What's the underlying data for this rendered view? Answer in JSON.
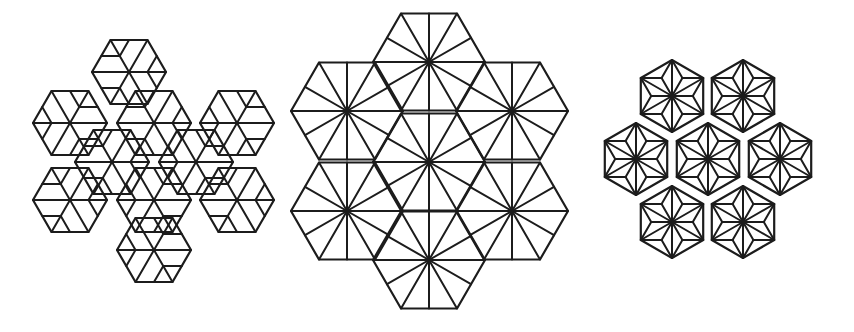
{
  "figure": {
    "stroke_color": "#1c1c1c",
    "background": "#ffffff",
    "panels": [
      {
        "id": "left",
        "label": "",
        "hexagons": [
          {
            "cx": 129,
            "cy": 72,
            "r": 37,
            "rot": 0
          },
          {
            "cx": 70,
            "cy": 123,
            "r": 37,
            "rot": 0
          },
          {
            "cx": 154,
            "cy": 123,
            "r": 37,
            "rot": 0
          },
          {
            "cx": 237,
            "cy": 123,
            "r": 37,
            "rot": 0
          },
          {
            "cx": 112,
            "cy": 162,
            "r": 37,
            "rot": 0
          },
          {
            "cx": 196,
            "cy": 162,
            "r": 37,
            "rot": 0
          },
          {
            "cx": 70,
            "cy": 200,
            "r": 37,
            "rot": 0
          },
          {
            "cx": 154,
            "cy": 200,
            "r": 37,
            "rot": 0
          },
          {
            "cx": 237,
            "cy": 200,
            "r": 37,
            "rot": 0
          },
          {
            "cx": 154,
            "cy": 250,
            "r": 37,
            "rot": 0
          }
        ],
        "style": "asymmetric-fan"
      },
      {
        "id": "center",
        "label": "",
        "hexagons": [
          {
            "cx": 429,
            "cy": 62,
            "r": 56,
            "rot": 0
          },
          {
            "cx": 347,
            "cy": 111,
            "r": 56,
            "rot": 0
          },
          {
            "cx": 512,
            "cy": 111,
            "r": 56,
            "rot": 0
          },
          {
            "cx": 429,
            "cy": 162,
            "r": 56,
            "rot": 0
          },
          {
            "cx": 347,
            "cy": 211,
            "r": 56,
            "rot": 0
          },
          {
            "cx": 512,
            "cy": 211,
            "r": 56,
            "rot": 0
          },
          {
            "cx": 429,
            "cy": 260,
            "r": 56,
            "rot": 0
          }
        ],
        "style": "12-spoke-star"
      },
      {
        "id": "right",
        "label": "",
        "hexagons": [
          {
            "cx": 672,
            "cy": 96,
            "r": 36,
            "rot": 30
          },
          {
            "cx": 743,
            "cy": 96,
            "r": 36,
            "rot": 30
          },
          {
            "cx": 636,
            "cy": 159,
            "r": 36,
            "rot": 30
          },
          {
            "cx": 708,
            "cy": 159,
            "r": 36,
            "rot": 30
          },
          {
            "cx": 780,
            "cy": 159,
            "r": 36,
            "rot": 30
          },
          {
            "cx": 672,
            "cy": 222,
            "r": 36,
            "rot": 30
          },
          {
            "cx": 743,
            "cy": 222,
            "r": 36,
            "rot": 30
          }
        ],
        "style": "asanoha"
      }
    ]
  }
}
